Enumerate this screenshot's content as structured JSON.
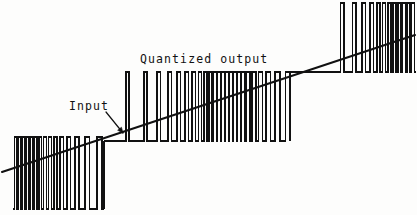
{
  "figure": {
    "kind": "waveform-diagram",
    "title_on_canvas": "Quantized output",
    "background_color": "#fdfdfc",
    "ink_color": "#111111",
    "width": 417,
    "height": 215
  },
  "labels": {
    "quantized_output": "Quantized output",
    "input": "Input"
  },
  "annotations": {
    "input_arrow": {
      "name": "input-arrow",
      "from_x": 106,
      "from_y": 112,
      "to_x": 123,
      "to_y": 133
    }
  },
  "chart_data": {
    "type": "line",
    "title": "Quantized output",
    "xlabel": "",
    "ylabel": "",
    "grid": false,
    "legend": false,
    "annotations": [
      "Input",
      "Quantized output"
    ],
    "xlim": [
      0,
      417
    ],
    "ylim": [
      215,
      0
    ],
    "series": [
      {
        "name": "Input",
        "description": "linear ramp input signal",
        "type": "line",
        "points": [
          [
            2,
            172
          ],
          [
            415,
            35
          ]
        ]
      },
      {
        "name": "Quantized output",
        "description": "pulse density modulated square wave, four baseline levels, density rising left to right",
        "type": "step",
        "levels": {
          "level0_baseline_y": 209,
          "level0_pulse_top_y": 137,
          "level1_baseline_y": 141,
          "level1_pulse_top_y": 72,
          "level2_baseline_y": 72,
          "level2_pulse_top_y": 3
        },
        "segments": [
          {
            "name": "segment-low",
            "x_start": 13,
            "x_end": 104,
            "baseline_y": 209,
            "pulse_top_y": 137,
            "polarity": "up",
            "pulses": [
              [
                14.5,
                17.0
              ],
              [
                18.5,
                21.0
              ],
              [
                22.5,
                25.0
              ],
              [
                26.5,
                29.0
              ],
              [
                30.5,
                33.0
              ],
              [
                34.5,
                37.0
              ],
              [
                39.0,
                41.5
              ],
              [
                43.5,
                46.5
              ],
              [
                48.5,
                51.5
              ],
              [
                54.0,
                57.0
              ],
              [
                60.0,
                63.5
              ],
              [
                67.0,
                70.5
              ],
              [
                75.0,
                79.0
              ],
              [
                85.0,
                89.5
              ],
              [
                97.0,
                102.0
              ]
            ]
          },
          {
            "name": "segment-mid-low",
            "x_start": 104,
            "x_end": 290,
            "baseline_y": 141,
            "pulse_top_y": 72,
            "polarity": "up",
            "pulses": [
              [
                126.0,
                129.0
              ],
              [
                144.0,
                147.0
              ],
              [
                157.0,
                160.5
              ],
              [
                168.0,
                171.5
              ],
              [
                177.0,
                180.5
              ],
              [
                185.0,
                188.5
              ],
              [
                192.0,
                195.5
              ],
              [
                198.5,
                201.5
              ],
              [
                204.0,
                207.0
              ],
              [
                209.0,
                212.0
              ],
              [
                213.5,
                216.5
              ],
              [
                217.5,
                220.5
              ],
              [
                221.5,
                224.5
              ],
              [
                225.5,
                228.5
              ],
              [
                229.5,
                232.5
              ],
              [
                233.5,
                236.5
              ],
              [
                237.5,
                240.5
              ],
              [
                241.5,
                245.0
              ],
              [
                246.5,
                250.0
              ],
              [
                252.0,
                256.0
              ],
              [
                258.5,
                262.5
              ],
              [
                266.0,
                270.5
              ],
              [
                275.0,
                280.0
              ],
              [
                285.5,
                290.0
              ]
            ]
          },
          {
            "name": "segment-mid-high",
            "x_start": 290,
            "x_end": 340,
            "baseline_y": 72,
            "pulse_top_y": 3,
            "polarity": "up",
            "pulses": []
          },
          {
            "name": "segment-high",
            "x_start": 340,
            "x_end": 416,
            "baseline_y": 72,
            "pulse_top_y": 3,
            "polarity": "up",
            "pulses": [
              [
                340.5,
                344.0
              ],
              [
                352.5,
                356.0
              ],
              [
                362.0,
                365.5
              ],
              [
                370.0,
                373.5
              ],
              [
                377.0,
                380.0
              ],
              [
                382.5,
                385.5
              ],
              [
                388.0,
                391.0
              ],
              [
                393.0,
                396.0
              ],
              [
                398.0,
                401.0
              ],
              [
                402.5,
                405.5
              ],
              [
                407.0,
                410.0
              ],
              [
                411.5,
                414.5
              ]
            ]
          }
        ]
      }
    ]
  }
}
